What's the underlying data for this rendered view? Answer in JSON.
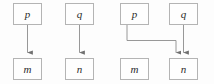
{
  "figure": {
    "type": "dependency-diagram",
    "background_color": "#fdfdfd",
    "box_border_color": "#b4b4b4",
    "box_fill_color": "#fefefe",
    "edge_color": "#8c8c8c",
    "label_color": "#2b2b2b",
    "panels": [
      {
        "id": "left-panel",
        "nodes": [
          {
            "id": "left-p",
            "label": "p",
            "x": 13,
            "y": 3,
            "w": 29,
            "h": 22
          },
          {
            "id": "left-q",
            "label": "q",
            "x": 65,
            "y": 3,
            "w": 29,
            "h": 22
          },
          {
            "id": "left-m",
            "label": "m",
            "x": 13,
            "y": 58,
            "w": 29,
            "h": 22
          },
          {
            "id": "left-n",
            "label": "n",
            "x": 65,
            "y": 58,
            "w": 29,
            "h": 22
          }
        ],
        "edges": [
          {
            "id": "edge-p-m",
            "from": "left-p",
            "to": "left-m",
            "shape": "straight-down",
            "arrow": "down"
          },
          {
            "id": "edge-q-n",
            "from": "left-q",
            "to": "left-n",
            "shape": "straight-down",
            "arrow": "down"
          }
        ]
      },
      {
        "id": "right-panel",
        "nodes": [
          {
            "id": "right-p",
            "label": "p",
            "x": 120,
            "y": 3,
            "w": 29,
            "h": 22
          },
          {
            "id": "right-q",
            "label": "q",
            "x": 169,
            "y": 3,
            "w": 29,
            "h": 22
          },
          {
            "id": "right-m",
            "label": "m",
            "x": 120,
            "y": 58,
            "w": 29,
            "h": 22
          },
          {
            "id": "right-n",
            "label": "n",
            "x": 169,
            "y": 58,
            "w": 29,
            "h": 22
          }
        ],
        "edges": [
          {
            "id": "edge-p-n",
            "from": "right-p",
            "to": "right-n",
            "shape": "elbow-right-down",
            "arrow": "down"
          },
          {
            "id": "edge-q-n",
            "from": "right-q",
            "to": "right-n",
            "shape": "straight-down",
            "arrow": "down"
          }
        ]
      }
    ]
  },
  "labels": {
    "left": {
      "p": "p",
      "q": "q",
      "m": "m",
      "n": "n"
    },
    "right": {
      "p": "p",
      "q": "q",
      "m": "m",
      "n": "n"
    }
  }
}
